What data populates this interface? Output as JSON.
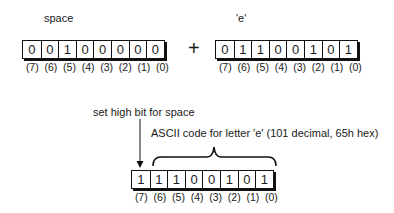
{
  "top": {
    "left_register": {
      "label": "space",
      "bits": [
        "0",
        "0",
        "1",
        "0",
        "0",
        "0",
        "0",
        "0"
      ],
      "indices": [
        "(7)",
        "(6)",
        "(5)",
        "(4)",
        "(3)",
        "(2)",
        "(1)",
        "(0)"
      ]
    },
    "operator": "+",
    "right_register": {
      "label": "'e'",
      "bits": [
        "0",
        "1",
        "1",
        "0",
        "0",
        "1",
        "0",
        "1"
      ],
      "indices": [
        "(7)",
        "(6)",
        "(5)",
        "(4)",
        "(3)",
        "(2)",
        "(1)",
        "(0)"
      ]
    }
  },
  "bottom": {
    "arrow_label": "set high bit for space",
    "brace_label": "ASCII code for letter 'e' (101 decimal, 65h hex)",
    "result_register": {
      "bits": [
        "1",
        "1",
        "1",
        "0",
        "0",
        "1",
        "0",
        "1"
      ],
      "indices": [
        "(7)",
        "(6)",
        "(5)",
        "(4)",
        "(3)",
        "(2)",
        "(1)",
        "(0)"
      ]
    }
  },
  "colors": {
    "line": "#111111",
    "background": "#ffffff"
  }
}
